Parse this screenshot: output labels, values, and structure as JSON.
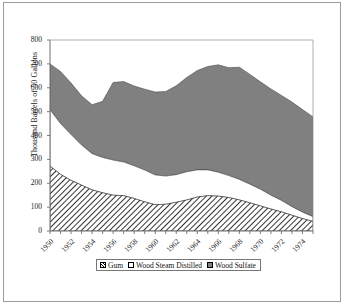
{
  "chart_data": {
    "type": "area",
    "stacked": true,
    "title": "",
    "subtitle": "",
    "xlabel": "",
    "ylabel": "Thousand Barrels of 50 Gallons",
    "ylim": [
      0,
      800
    ],
    "ytick_values": [
      0,
      100,
      200,
      300,
      400,
      500,
      600,
      700,
      800
    ],
    "ytick_labels": [
      "0",
      "100",
      "200",
      "300",
      "400",
      "500",
      "600",
      "700",
      "800"
    ],
    "grid": false,
    "legend_position": "bottom",
    "x": [
      1950,
      1951,
      1952,
      1953,
      1954,
      1955,
      1956,
      1957,
      1958,
      1959,
      1960,
      1961,
      1962,
      1963,
      1964,
      1965,
      1966,
      1967,
      1968,
      1969,
      1970,
      1971,
      1972,
      1973,
      1974,
      1975
    ],
    "xtick_labels": [
      "1950",
      "1952",
      "1954",
      "1956",
      "1958",
      "1960",
      "1962",
      "1964",
      "1966",
      "1968",
      "1970",
      "1972",
      "1974"
    ],
    "xtick_values": [
      1950,
      1952,
      1954,
      1956,
      1958,
      1960,
      1962,
      1964,
      1966,
      1968,
      1970,
      1972,
      1974
    ],
    "series": [
      {
        "name": "Gum",
        "fill": "hatch",
        "values": [
          272,
          237,
          212,
          192,
          172,
          160,
          150,
          148,
          136,
          122,
          110,
          112,
          120,
          130,
          142,
          148,
          146,
          140,
          130,
          118,
          105,
          92,
          80,
          66,
          52,
          40
        ]
      },
      {
        "name": "Wood Steam Distilled",
        "fill": "white",
        "values": [
          236,
          213,
          192,
          168,
          152,
          148,
          147,
          141,
          137,
          133,
          125,
          118,
          116,
          118,
          114,
          108,
          100,
          92,
          86,
          78,
          70,
          58,
          48,
          36,
          27,
          20
        ]
      },
      {
        "name": "Wood Sulfate",
        "fill": "gray",
        "values": [
          192,
          218,
          216,
          206,
          205,
          235,
          325,
          337,
          334,
          339,
          347,
          354,
          372,
          395,
          416,
          433,
          450,
          452,
          470,
          460,
          450,
          445,
          440,
          438,
          430,
          418
        ]
      }
    ],
    "series_totals_note": "Stacked totals peak near 700 thousand barrels in 1950 and again near 700 in 1965-1966, declining to about 480 by 1975."
  },
  "legend": {
    "items": [
      {
        "label": "Gum",
        "swatch": "hatch-swatch"
      },
      {
        "label": "Wood Steam Distilled",
        "swatch": "white-swatch"
      },
      {
        "label": "Wood Sulfate",
        "swatch": "gray-swatch"
      }
    ]
  },
  "colors": {
    "gray_fill": "#808080",
    "hatch_line": "#000000",
    "white_fill": "#ffffff",
    "axis": "#6e6e6e",
    "frame": "#9a9a9a",
    "text": "#1a1a1a"
  }
}
